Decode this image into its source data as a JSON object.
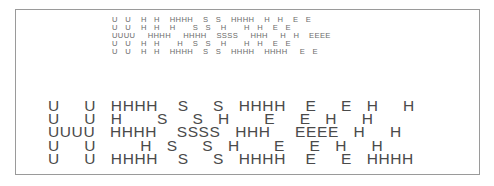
{
  "figure": {
    "frame_border_color": "#9a9a9a",
    "text_color_small": "#6a6a6a",
    "text_color_large": "#4a4a4a"
  },
  "small_banner": {
    "rows": [
      "U   U    H   H    HHHH    S   S    HHHH    H   H    E   E",
      "U   U    H   H    H       S   S    H       H   H    E   E",
      "UUUU     HHHH     HHHH    SSSS     HHH     H   H    EEEE",
      "U   U    H   H       H    S   S    H       H   H    E   E",
      "U   U    H   H    HHHH    S   S    HHHH    HHHH     E   E"
    ]
  },
  "large_banner": {
    "rows": [
      "U     U   HHHH    S     S   HHHH    E     E   H     H",
      "U     U   H       S     S   H       E     E   H     H",
      "UUUU   HHHH    SSSS   HHH     EEEE   H     H",
      "U     U         H   S     S   H       E     E   H     H",
      "U     U   HHHH    S     S   HHHH    E     E   HHHH"
    ]
  }
}
